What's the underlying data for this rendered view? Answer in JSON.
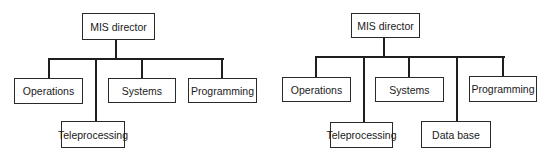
{
  "diagrams": [
    {
      "root": "MIS director",
      "children": [
        "Operations",
        "Teleprocessing",
        "Systems",
        "Programming"
      ]
    },
    {
      "root": "MIS director",
      "children": [
        "Operations",
        "Teleprocessing",
        "Systems",
        "Data base",
        "Programming"
      ]
    }
  ],
  "colors": {
    "line": "#1e1e1e",
    "box_border": "#2a2a2a",
    "background": "#ffffff"
  }
}
